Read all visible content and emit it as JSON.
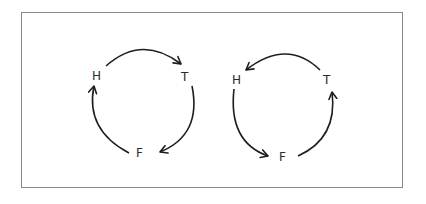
{
  "diagram": {
    "cycle_left": {
      "direction": "clockwise",
      "nodes": [
        {
          "label": "H",
          "x": 96,
          "y": 80
        },
        {
          "label": "T",
          "x": 185,
          "y": 81
        },
        {
          "label": "F",
          "x": 140,
          "y": 157
        }
      ],
      "edges": [
        {
          "from": "H",
          "to": "T"
        },
        {
          "from": "T",
          "to": "F"
        },
        {
          "from": "F",
          "to": "H"
        }
      ]
    },
    "cycle_right": {
      "direction": "counterclockwise",
      "nodes": [
        {
          "label": "H",
          "x": 236,
          "y": 84
        },
        {
          "label": "T",
          "x": 327,
          "y": 84
        },
        {
          "label": "F",
          "x": 283,
          "y": 161
        }
      ],
      "edges": [
        {
          "from": "T",
          "to": "H"
        },
        {
          "from": "H",
          "to": "F"
        },
        {
          "from": "F",
          "to": "T"
        }
      ]
    },
    "colors": {
      "stroke": "#1e1e1e",
      "border": "#8a8a8a",
      "background": "#ffffff"
    }
  }
}
